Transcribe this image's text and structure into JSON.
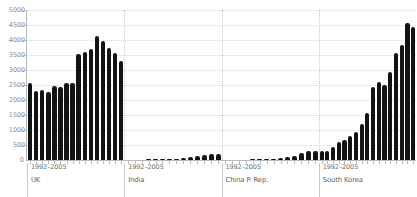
{
  "chart_data": {
    "type": "bar",
    "title": "",
    "subtitle": "",
    "xlabel": "",
    "ylabel": "",
    "ylim": [
      0,
      5000
    ],
    "grid": true,
    "legend": false,
    "y_ticks": [
      0,
      500,
      1000,
      1500,
      2000,
      2500,
      3000,
      3500,
      4000,
      4500,
      5000
    ],
    "y_tick_labels": [
      "0",
      "500",
      "1000",
      "1500",
      "2000",
      "2500",
      "3000",
      "3500",
      "4000",
      "4500",
      "5000"
    ],
    "x_range_label": "1992–2005",
    "x": [
      1992,
      1993,
      1994,
      1995,
      1996,
      1997,
      1998,
      1999,
      2000,
      2001,
      2002,
      2003,
      2004,
      2005
    ],
    "panels": [
      {
        "name": "UK",
        "x_label": "1992–2005",
        "values": [
          2570,
          2290,
          2320,
          2270,
          2470,
          2450,
          2580,
          2580,
          3540,
          3600,
          3690,
          4120,
          3980,
          3730
        ]
      },
      {
        "name": "India",
        "x_label": "1992–2005",
        "values": [
          10,
          12,
          15,
          18,
          24,
          30,
          38,
          48,
          62,
          88,
          120,
          175,
          195,
          200
        ]
      },
      {
        "name": "China P. Rep.",
        "x_label": "1992–2005",
        "values": [
          8,
          10,
          13,
          17,
          22,
          28,
          36,
          48,
          65,
          95,
          150,
          230,
          285,
          300
        ]
      },
      {
        "name": "South Korea",
        "x_label": "1992–2005",
        "values": [
          300,
          290,
          430,
          600,
          680,
          790,
          950,
          1210,
          1560,
          2420,
          2600,
          2500,
          2950,
          3180
        ]
      }
    ],
    "panels_tail": {
      "UK": [
        3730,
        3560,
        3290
      ],
      "South Korea": [
        3560,
        3820,
        4560,
        4420
      ]
    },
    "colors": {
      "bar": "#131313",
      "grid": "#d8d8d8",
      "axis": "#b9b9b9",
      "tick_text": "#8a8a8a",
      "strip_text": "#5a5a5a",
      "background": "#ffffff"
    }
  }
}
